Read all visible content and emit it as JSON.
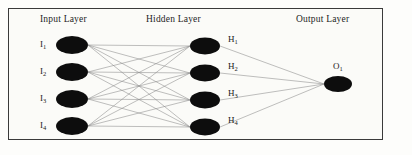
{
  "figure": {
    "type": "neural-network-diagram",
    "width": 412,
    "height": 155,
    "background_color": "#fdfdfb",
    "frame_color": "#3a3a3a",
    "node_color": "#0d0d0d",
    "edge_color": "#8a8a8a"
  },
  "titles": {
    "input": "Input Layer",
    "hidden": "Hidden Layer",
    "output": "Output Layer"
  },
  "layers": [
    {
      "id": "input",
      "title": "Input Layer",
      "label_side": "left",
      "nodes": [
        {
          "label": "I",
          "subscript": "1",
          "cx": 72,
          "cy": 45,
          "rx": 16,
          "ry": 9
        },
        {
          "label": "I",
          "subscript": "2",
          "cx": 72,
          "cy": 72,
          "rx": 16,
          "ry": 9
        },
        {
          "label": "I",
          "subscript": "3",
          "cx": 72,
          "cy": 99,
          "rx": 16,
          "ry": 9
        },
        {
          "label": "I",
          "subscript": "4",
          "cx": 72,
          "cy": 126,
          "rx": 16,
          "ry": 9
        }
      ]
    },
    {
      "id": "hidden",
      "title": "Hidden Layer",
      "label_side": "right",
      "nodes": [
        {
          "label": "H",
          "subscript": "1",
          "cx": 205,
          "cy": 46,
          "rx": 15,
          "ry": 8.5
        },
        {
          "label": "H",
          "subscript": "2",
          "cx": 205,
          "cy": 73,
          "rx": 15,
          "ry": 8.5
        },
        {
          "label": "H",
          "subscript": "3",
          "cx": 205,
          "cy": 100,
          "rx": 15,
          "ry": 8.5
        },
        {
          "label": "H",
          "subscript": "4",
          "cx": 205,
          "cy": 127,
          "rx": 15,
          "ry": 8.5
        }
      ]
    },
    {
      "id": "output",
      "title": "Output Layer",
      "label_side": "above",
      "nodes": [
        {
          "label": "O",
          "subscript": "1",
          "cx": 338,
          "cy": 84,
          "rx": 14,
          "ry": 8
        }
      ]
    }
  ],
  "connections": {
    "input_to_hidden": "fully-connected 4x4",
    "hidden_to_output": "fully-connected 4x1",
    "total_edges": 20
  }
}
